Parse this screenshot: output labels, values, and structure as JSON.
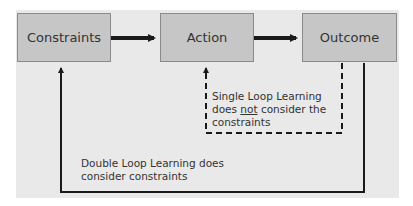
{
  "diagram": {
    "nodes": [
      {
        "id": "constraints",
        "label": "Constraints"
      },
      {
        "id": "action",
        "label": "Action"
      },
      {
        "id": "outcome",
        "label": "Outcome"
      }
    ],
    "edges": [
      {
        "from": "constraints",
        "to": "action",
        "style": "solid-thick"
      },
      {
        "from": "action",
        "to": "outcome",
        "style": "solid-thick"
      },
      {
        "from": "outcome",
        "to": "action",
        "style": "dashed",
        "label": "single_loop"
      },
      {
        "from": "outcome",
        "to": "constraints",
        "style": "solid",
        "label": "double_loop"
      }
    ],
    "single_loop": {
      "line1": "Single Loop Learning",
      "line2_pre": "does ",
      "line2_emph": "not",
      "line2_post": " consider the",
      "line3": "constraints"
    },
    "double_loop": {
      "line1": "Double Loop Learning does",
      "line2": "consider constraints"
    },
    "colors": {
      "background": "#e9e9e9",
      "box_fill": "#c6c6c6",
      "box_border": "#8a8a8a",
      "line": "#1a1a1a",
      "text": "#333333"
    }
  }
}
